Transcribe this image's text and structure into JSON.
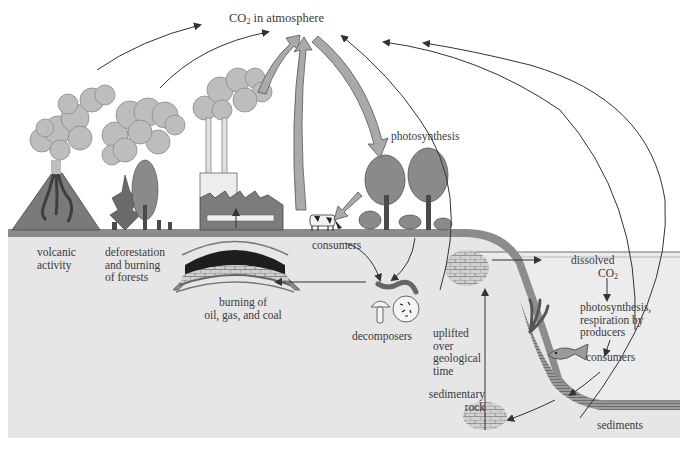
{
  "figure": {
    "colors": {
      "background": "#ffffff",
      "ground": "#e6e6e6",
      "soil_band": "#8c8c8c",
      "water_line": "#6e6e6e",
      "smoke": "#bdbdbd",
      "arrow_fill": "#a9a9a9",
      "arrow_line": "#333333",
      "text": "#3a3a3a"
    }
  },
  "labels": {
    "co2_atmosphere": {
      "prefix": "CO",
      "sub": "2",
      "suffix": " in atmosphere"
    },
    "volcanic": [
      "volcanic",
      "activity"
    ],
    "deforestation": [
      "deforestation",
      "and burning",
      "of forests"
    ],
    "burning_fossil": [
      "burning of",
      "oil, gas, and coal"
    ],
    "photosynthesis": "photosynthesis",
    "consumers_land": "consumers",
    "decomposers": "decomposers",
    "uplifted": [
      "uplifted",
      "over",
      "geological",
      "time"
    ],
    "sedimentary_rock": [
      "sedimentary",
      "rock"
    ],
    "dissolved_co2": {
      "line1": "dissolved",
      "prefix": "CO",
      "sub": "2"
    },
    "photosynthesis_marine": [
      "photosynthesis,",
      "respiration by",
      "producers"
    ],
    "consumers_marine": "consumers",
    "sediments": "sediments"
  },
  "icons": {
    "volcano": "volcano-icon",
    "burning_forest": "burning-forest-icon",
    "factory": "factory-icon",
    "trees": "tree-icon",
    "cow": "cow-icon",
    "worm": "worm-icon",
    "mushroom": "mushroom-icon",
    "bacteria": "bacteria-icon",
    "fish": "fish-icon",
    "seaweed": "seaweed-icon",
    "fossil_fuel_deposit": "fossil-fuel-deposit-icon",
    "rock": "sedimentary-rock-icon"
  }
}
